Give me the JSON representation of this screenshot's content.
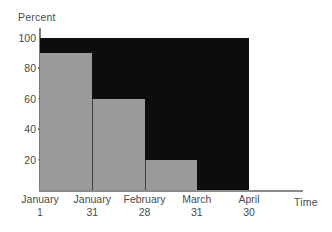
{
  "chart_data": {
    "type": "bar",
    "title": "",
    "subtitle": "",
    "xlabel": "Time",
    "ylabel": "Percent",
    "ylim": [
      0,
      100
    ],
    "yticks": [
      100,
      80,
      60,
      40,
      20
    ],
    "ytick_labels": [
      "100",
      "80",
      "60",
      "40",
      "20"
    ],
    "grid": false,
    "legend": false,
    "legend_position": "none",
    "x_boundaries": [
      "January 1",
      "January 31",
      "February 28",
      "March 31",
      "April 30"
    ],
    "x_boundary_lines": [
      {
        "month": "January",
        "day": "1"
      },
      {
        "month": "January",
        "day": "31"
      },
      {
        "month": "February",
        "day": "28"
      },
      {
        "month": "March",
        "day": "31"
      },
      {
        "month": "April",
        "day": "30"
      }
    ],
    "categories": [
      "January 1 - January 31",
      "January 31 - February 28",
      "February 28 - March 31",
      "March 31 - April 30"
    ],
    "values": [
      90,
      60,
      20,
      0
    ],
    "series": [
      {
        "name": "Percent remaining",
        "values": [
          90,
          60,
          20,
          0
        ]
      }
    ],
    "annotations": [
      "Step-style survival chart: gray bars show percent remaining over each interval; black region shows the complement."
    ],
    "colors": {
      "bar_fill": "#9a9a9a",
      "plot_background": "#0d0d0d",
      "page_background": "#ffffff",
      "axis_line": "#82838a",
      "text": "#4a4a4a",
      "bar_divider": "#3d3e3e"
    }
  }
}
